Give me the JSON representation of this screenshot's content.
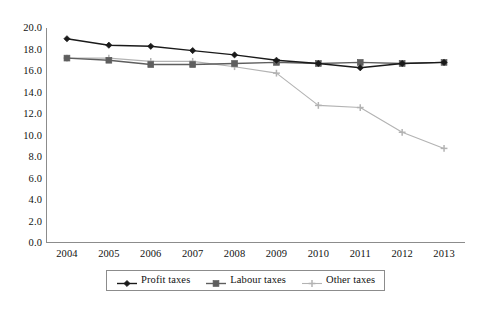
{
  "chart_data": {
    "type": "line",
    "title": "",
    "subtitle": "",
    "xlabel": "",
    "ylabel": "",
    "categories": [
      "2004",
      "2005",
      "2006",
      "2007",
      "2008",
      "2009",
      "2010",
      "2011",
      "2012",
      "2013"
    ],
    "xtick_labels": [
      "2004",
      "2005",
      "2006",
      "2007",
      "2008",
      "2009",
      "2010",
      "2011",
      "2012",
      "2013"
    ],
    "ytick_labels": [
      "0.0",
      "2.0",
      "4.0",
      "6.0",
      "8.0",
      "10.0",
      "12.0",
      "14.0",
      "16.0",
      "18.0",
      "20.0"
    ],
    "ytick_values": [
      0,
      2,
      4,
      6,
      8,
      10,
      12,
      14,
      16,
      18,
      20
    ],
    "ylim": [
      0,
      20
    ],
    "grid": false,
    "legend_position": "bottom",
    "series": [
      {
        "name": "Profit taxes",
        "color": "#1a1a1a",
        "marker": "diamond",
        "values": [
          19.0,
          18.4,
          18.3,
          17.9,
          17.5,
          17.0,
          16.7,
          16.3,
          16.7,
          16.8
        ]
      },
      {
        "name": "Labour taxes",
        "color": "#5e5e5e",
        "marker": "square",
        "values": [
          17.2,
          17.0,
          16.6,
          16.6,
          16.7,
          16.8,
          16.7,
          16.8,
          16.7,
          16.8
        ]
      },
      {
        "name": "Other taxes",
        "color": "#b3b3b3",
        "marker": "cross",
        "values": [
          17.2,
          17.2,
          16.9,
          16.9,
          16.4,
          15.8,
          12.8,
          12.6,
          10.3,
          8.8
        ]
      }
    ]
  },
  "legend": {
    "entries": [
      {
        "label": "Profit taxes"
      },
      {
        "label": "Labour taxes"
      },
      {
        "label": "Other taxes"
      }
    ]
  },
  "axes": {
    "axis_color": "#8c8c8c",
    "tick_color": "#8c8c8c",
    "background": "#ffffff"
  }
}
